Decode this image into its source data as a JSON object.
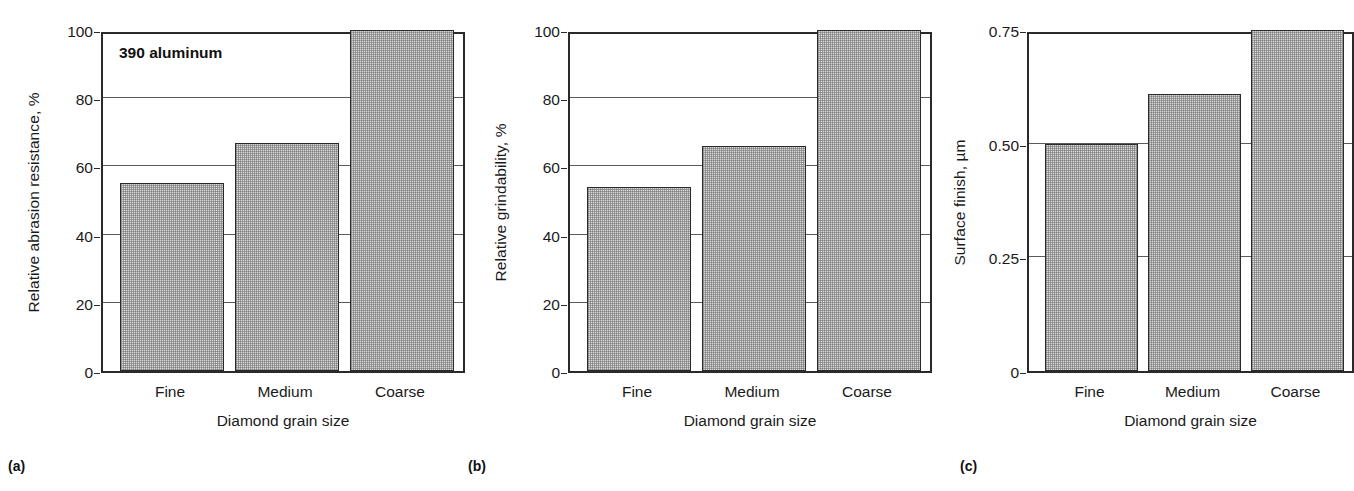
{
  "figure": {
    "background": "#ffffff",
    "bar_fill": "#d9d9d9",
    "bar_edge": "#2a2a2a",
    "axis_color": "#2a2a2a",
    "grid_color": "#5a5a5a"
  },
  "panels": [
    {
      "tag": "(a)",
      "annotation": "390 aluminum",
      "chart_data": {
        "type": "bar",
        "title": "",
        "xlabel": "Diamond grain size",
        "ylabel": "Relative abrasion resistance, %",
        "categories": [
          "Fine",
          "Medium",
          "Coarse"
        ],
        "values": [
          55,
          67,
          100
        ],
        "ylim": [
          0,
          100
        ],
        "yticks": [
          0,
          20,
          40,
          60,
          80,
          100
        ],
        "ytick_labels": [
          "0",
          "20",
          "40",
          "60",
          "80",
          "100"
        ],
        "grid": true,
        "legend": "none",
        "annotations": [
          "390 aluminum"
        ]
      }
    },
    {
      "tag": "(b)",
      "annotation": "",
      "chart_data": {
        "type": "bar",
        "title": "",
        "xlabel": "Diamond grain size",
        "ylabel": "Relative grindability, %",
        "categories": [
          "Fine",
          "Medium",
          "Coarse"
        ],
        "values": [
          54,
          66,
          100
        ],
        "ylim": [
          0,
          100
        ],
        "yticks": [
          0,
          20,
          40,
          60,
          80,
          100
        ],
        "ytick_labels": [
          "0",
          "20",
          "40",
          "60",
          "80",
          "100"
        ],
        "grid": true,
        "legend": "none",
        "annotations": []
      }
    },
    {
      "tag": "(c)",
      "annotation": "",
      "chart_data": {
        "type": "bar",
        "title": "",
        "xlabel": "Diamond grain size",
        "ylabel": "Surface finish, µm",
        "categories": [
          "Fine",
          "Medium",
          "Coarse"
        ],
        "values": [
          0.5,
          0.61,
          0.75
        ],
        "ylim": [
          0,
          0.75
        ],
        "yticks": [
          0,
          0.25,
          0.5,
          0.75
        ],
        "ytick_labels": [
          "0",
          "0.25",
          "0.50",
          "0.75"
        ],
        "grid": true,
        "legend": "none",
        "annotations": []
      }
    }
  ]
}
